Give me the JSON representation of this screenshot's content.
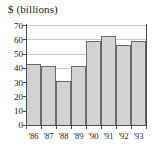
{
  "chart_data": {
    "type": "bar",
    "title": "$ (billions)",
    "subtitle": "",
    "xlabel": "",
    "ylabel": "",
    "categories": [
      "'86",
      "'87",
      "'88",
      "'89",
      "'90",
      "'91",
      "'92",
      "'93"
    ],
    "values": [
      42.5,
      41,
      31,
      41,
      58.5,
      62.5,
      56,
      59
    ],
    "series": [
      {
        "name": "$ (billions)",
        "values": [
          42.5,
          41,
          31,
          41,
          58.5,
          62.5,
          56,
          59
        ]
      }
    ],
    "ylim": [
      0,
      70
    ],
    "yticks": [
      0,
      10,
      20,
      30,
      40,
      50,
      60,
      70
    ],
    "ytick_labels": [
      "0",
      "10",
      "20",
      "30",
      "40",
      "50",
      "60",
      "70"
    ],
    "xtick_labels": [
      "'86",
      "'87",
      "'88",
      "'89",
      "'90",
      "'91",
      "'92",
      "'93"
    ],
    "grid": true,
    "grid_axis": "y",
    "legend": false,
    "legend_position": "none",
    "bar_fill_color": "#d2d2d2",
    "bar_edge_color": "#6b6b6b",
    "gridline_color": "#c9c9c9",
    "axis_color": "#4a4a4a",
    "text_color": "#1a1a1a",
    "background_color": "#ffffff",
    "annotations": []
  }
}
